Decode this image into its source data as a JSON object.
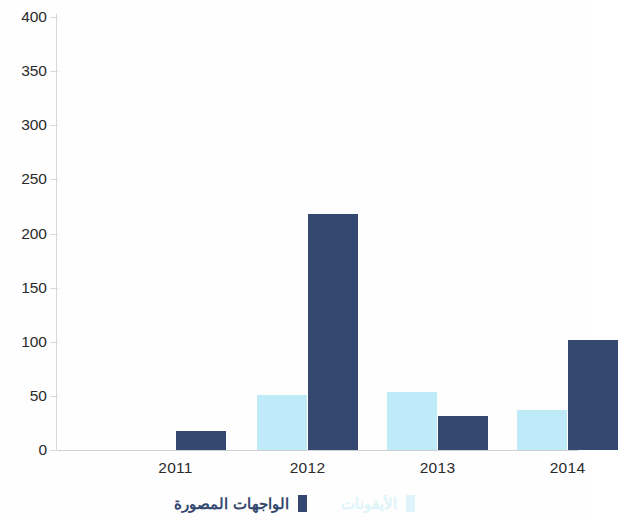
{
  "chart_data": {
    "type": "bar",
    "title": "",
    "subtitle": "",
    "xlabel": "",
    "ylabel": "",
    "categories": [
      "2011",
      "2012",
      "2013",
      "2014"
    ],
    "ylim": [
      0,
      400
    ],
    "yticks": [
      "0",
      "50",
      "100",
      "150",
      "200",
      "250",
      "300",
      "350",
      "400"
    ],
    "ytick_values": [
      0,
      50,
      100,
      150,
      200,
      250,
      300,
      350,
      400
    ],
    "grid": false,
    "legend_position": "bottom",
    "direction": "rtl",
    "series": [
      {
        "name": "الأيقونات",
        "color": "#bfeaf7",
        "legend_color": "#ddf4fb",
        "values": [
          0,
          51,
          54,
          37
        ]
      },
      {
        "name": "الواجهات المصورة",
        "color": "#35486f",
        "legend_color": "#35486f",
        "values": [
          18,
          218,
          31,
          102
        ]
      }
    ]
  },
  "axis": {
    "y_labels": [
      "400",
      "350",
      "300",
      "250",
      "200",
      "150",
      "100",
      "50",
      "0"
    ],
    "x_labels": [
      "2011",
      "2012",
      "2013",
      "2014"
    ]
  },
  "legend": {
    "items": [
      {
        "label": "الأيقونات",
        "swatch": "#ddf4fb"
      },
      {
        "label": "الواجهات المصورة",
        "swatch": "#35486f"
      }
    ]
  }
}
